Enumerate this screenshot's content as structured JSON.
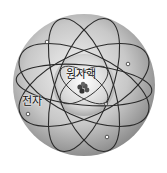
{
  "diagram": {
    "type": "atom-model",
    "labels": {
      "nucleus": "원자핵",
      "electron": "전자"
    },
    "colors": {
      "outer_sphere_light": "#f0f0f0",
      "outer_sphere_dark": "#8a8a8a",
      "inner_sphere_light": "#ffffff",
      "inner_sphere_dark": "#9a9a9a",
      "orbit_line": "#2a2a2a",
      "background": "#ffffff"
    }
  }
}
